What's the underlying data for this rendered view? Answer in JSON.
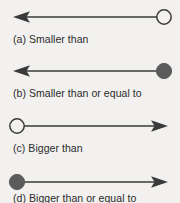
{
  "figure": {
    "background_color": "#f2f1ef",
    "stroke_color": "#3a3a3a",
    "fill_color": "#5b5b5b",
    "open_circle_fill": "#f2f1ef",
    "rows": [
      {
        "id": "a",
        "caption": "(a) Smaller than",
        "endpoint": "open-circle",
        "endpoint_side": "right",
        "arrow_direction": "left",
        "meaning": "smaller than"
      },
      {
        "id": "b",
        "caption": "(b) Smaller than or equal to",
        "endpoint": "filled-circle",
        "endpoint_side": "right",
        "arrow_direction": "left",
        "meaning": "smaller than or equal to"
      },
      {
        "id": "c",
        "caption": "(c) Bigger than",
        "endpoint": "open-circle",
        "endpoint_side": "left",
        "arrow_direction": "right",
        "meaning": "bigger than"
      },
      {
        "id": "d",
        "caption": "(d) Bigger than or equal to",
        "endpoint": "filled-circle",
        "endpoint_side": "left",
        "arrow_direction": "right",
        "meaning": "bigger than or equal to"
      }
    ]
  }
}
